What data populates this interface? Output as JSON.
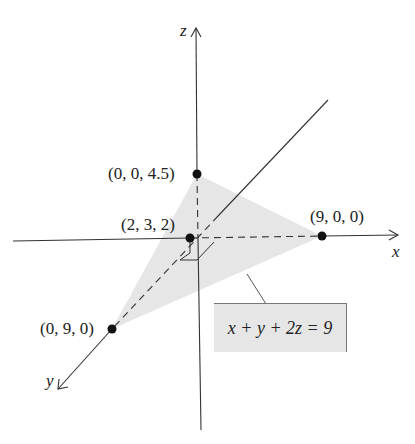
{
  "diagram": {
    "axes": {
      "x_label": "x",
      "y_label": "y",
      "z_label": "z"
    },
    "points": [
      {
        "label": "(0, 0, 4.5)",
        "coords": [
          0,
          0,
          4.5
        ]
      },
      {
        "label": "(9, 0, 0)",
        "coords": [
          9,
          0,
          0
        ]
      },
      {
        "label": "(0, 9, 0)",
        "coords": [
          0,
          9,
          0
        ]
      },
      {
        "label": "(2, 3, 2)",
        "coords": [
          2,
          3,
          2
        ]
      }
    ],
    "plane_equation": "x + y + 2z = 9",
    "colors": {
      "plane_fill": "#e6e6e6",
      "line": "#333333",
      "point": "#111111"
    }
  }
}
